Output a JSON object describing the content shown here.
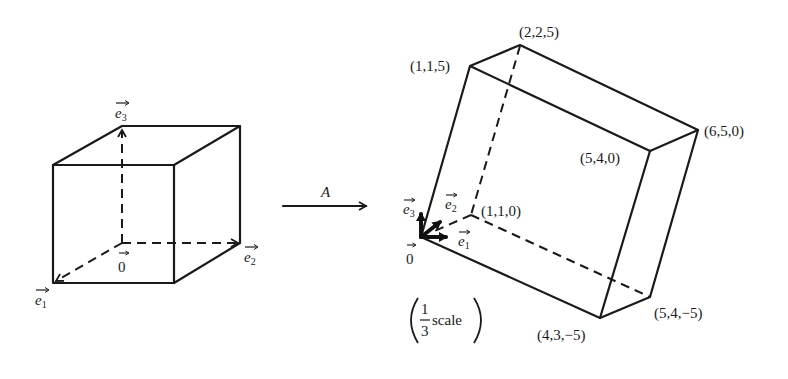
{
  "left_cube": {
    "basis_labels": {
      "e1": "e",
      "e1_sub": "1",
      "e2": "e",
      "e2_sub": "2",
      "e3": "e",
      "e3_sub": "3"
    },
    "origin_label": "0"
  },
  "transform": {
    "label": "A"
  },
  "right_prism": {
    "vertices": {
      "v115": "(1,1,5)",
      "v225": "(2,2,5)",
      "v650": "(6,5,0)",
      "v540": "(5,4,0)",
      "v110": "(1,1,0)",
      "v54m5": "(5,4,−5)",
      "v43m5": "(4,3,−5)"
    },
    "basis_labels": {
      "e1": "e",
      "e1_sub": "1",
      "e2": "e",
      "e2_sub": "2",
      "e3": "e",
      "e3_sub": "3"
    },
    "origin_label": "0",
    "scale_note": {
      "numerator": "1",
      "denominator": "3",
      "word": "scale"
    }
  }
}
